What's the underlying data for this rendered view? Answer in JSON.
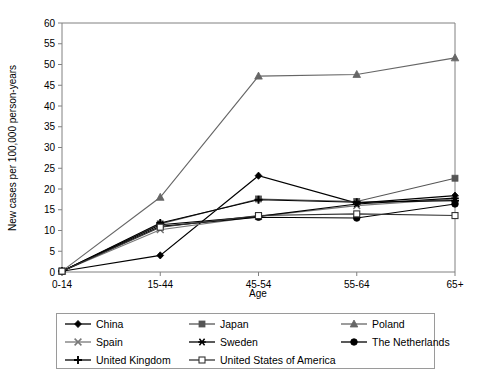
{
  "chart_data": {
    "type": "line",
    "title": "",
    "xlabel": "Age",
    "ylabel": "New cases per 100,000 person-years",
    "categories": [
      "0-14",
      "15-44",
      "45-54",
      "55-64",
      "65+"
    ],
    "ylim": [
      0,
      60
    ],
    "ytick_step": 5,
    "yticks": [
      "0",
      "5",
      "10",
      "15",
      "20",
      "25",
      "30",
      "35",
      "40",
      "45",
      "50",
      "55",
      "60"
    ],
    "grid": false,
    "legend_position": "bottom",
    "series": [
      {
        "name": "China",
        "marker": "filled-diamond",
        "color": "#000000",
        "values": [
          0.2,
          4.0,
          23.2,
          16.6,
          18.4
        ]
      },
      {
        "name": "Japan",
        "marker": "filled-square",
        "color": "#555555",
        "values": [
          0.2,
          11.6,
          17.6,
          17.0,
          22.6
        ]
      },
      {
        "name": "Poland",
        "marker": "filled-triangle",
        "color": "#666666",
        "values": [
          0.2,
          18.0,
          47.2,
          47.6,
          51.6
        ]
      },
      {
        "name": "Spain",
        "marker": "x-cross",
        "color": "#777777",
        "values": [
          0.2,
          10.2,
          13.4,
          16.0,
          17.6
        ]
      },
      {
        "name": "Sweden",
        "marker": "asterisk",
        "color": "#000000",
        "values": [
          0.2,
          11.4,
          13.4,
          16.4,
          17.8
        ]
      },
      {
        "name": "The Netherlands",
        "marker": "filled-circle",
        "color": "#000000",
        "values": [
          0.2,
          11.0,
          13.2,
          13.0,
          16.4
        ]
      },
      {
        "name": "United Kingdom",
        "marker": "plus",
        "color": "#000000",
        "values": [
          0.2,
          11.8,
          17.4,
          16.8,
          17.2
        ]
      },
      {
        "name": "United States of America",
        "marker": "open-square",
        "color": "#333333",
        "values": [
          0.2,
          10.8,
          13.6,
          14.0,
          13.6
        ]
      }
    ]
  },
  "legend": {
    "items": [
      {
        "label": "China"
      },
      {
        "label": "Japan"
      },
      {
        "label": "Poland"
      },
      {
        "label": "Spain"
      },
      {
        "label": "Sweden"
      },
      {
        "label": "The Netherlands"
      },
      {
        "label": "United Kingdom"
      },
      {
        "label": "United States of America"
      }
    ]
  }
}
